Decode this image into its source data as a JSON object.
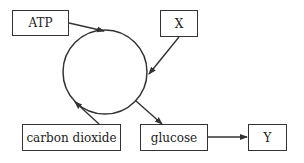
{
  "diagram": {
    "type": "cycle",
    "cycle_node": "circle",
    "nodes": [
      {
        "id": "atp",
        "label": "ATP",
        "role": "input"
      },
      {
        "id": "x",
        "label": "X",
        "role": "input"
      },
      {
        "id": "carbon_dioxide",
        "label": "carbon dioxide",
        "role": "input"
      },
      {
        "id": "glucose",
        "label": "glucose",
        "role": "output"
      },
      {
        "id": "y",
        "label": "Y",
        "role": "product"
      }
    ],
    "edges": [
      {
        "from": "atp",
        "to": "cycle"
      },
      {
        "from": "x",
        "to": "cycle"
      },
      {
        "from": "carbon_dioxide",
        "to": "cycle"
      },
      {
        "from": "cycle",
        "to": "glucose"
      },
      {
        "from": "glucose",
        "to": "y"
      }
    ],
    "colors": {
      "stroke": "#333333",
      "background": "#ffffff"
    }
  }
}
